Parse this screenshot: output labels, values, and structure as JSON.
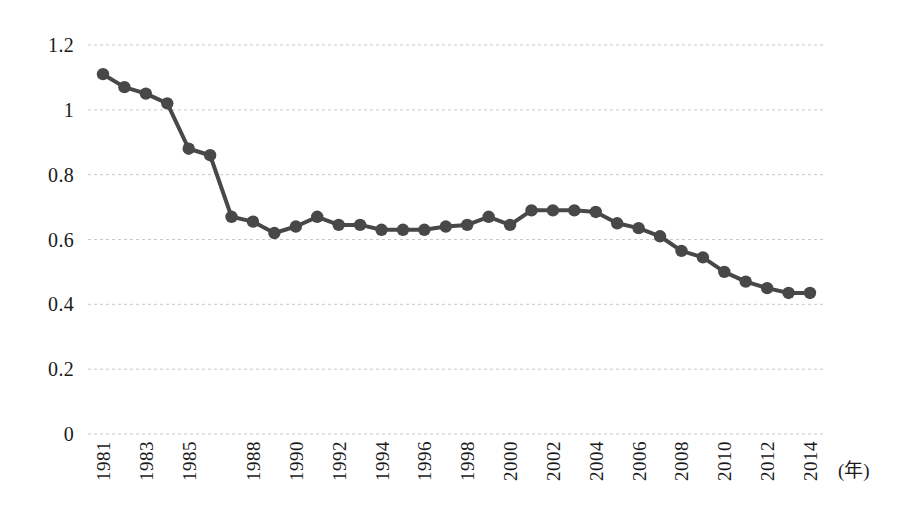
{
  "chart_data": {
    "type": "line",
    "title": "",
    "xlabel": "(年)",
    "ylabel": "",
    "xlim": [
      1981,
      2014
    ],
    "ylim": [
      0,
      1.2
    ],
    "grid": true,
    "legend": null,
    "marker": "circle",
    "series_color": "#484848",
    "y_ticks": [
      0,
      0.2,
      0.4,
      0.6,
      0.8,
      1,
      1.2
    ],
    "y_tick_labels": [
      "0",
      "0.2",
      "0.4",
      "0.6",
      "0.8",
      "1",
      "1.2"
    ],
    "x_tick_labels": [
      "1981",
      "1983",
      "1985",
      "1988",
      "1990",
      "1992",
      "1994",
      "1996",
      "1998",
      "2000",
      "2002",
      "2004",
      "2006",
      "2008",
      "2010",
      "2012",
      "2014"
    ],
    "x": [
      1981,
      1982,
      1983,
      1984,
      1985,
      1986,
      1987,
      1988,
      1989,
      1990,
      1991,
      1992,
      1993,
      1994,
      1995,
      1996,
      1997,
      1998,
      1999,
      2000,
      2001,
      2002,
      2003,
      2004,
      2005,
      2006,
      2007,
      2008,
      2009,
      2010,
      2011,
      2012,
      2013,
      2014
    ],
    "values": [
      1.11,
      1.07,
      1.05,
      1.02,
      0.88,
      0.86,
      0.67,
      0.655,
      0.62,
      0.64,
      0.67,
      0.645,
      0.645,
      0.63,
      0.63,
      0.63,
      0.64,
      0.645,
      0.67,
      0.645,
      0.69,
      0.69,
      0.69,
      0.685,
      0.65,
      0.635,
      0.61,
      0.565,
      0.545,
      0.5,
      0.47,
      0.45,
      0.435,
      0.435
    ],
    "series": [
      {
        "name": "値",
        "values": [
          1.11,
          1.07,
          1.05,
          1.02,
          0.88,
          0.86,
          0.67,
          0.655,
          0.62,
          0.64,
          0.67,
          0.645,
          0.645,
          0.63,
          0.63,
          0.63,
          0.64,
          0.645,
          0.67,
          0.645,
          0.69,
          0.69,
          0.69,
          0.685,
          0.65,
          0.635,
          0.61,
          0.565,
          0.545,
          0.5,
          0.47,
          0.45,
          0.435,
          0.435
        ]
      }
    ]
  },
  "axis": {
    "y_labels": [
      "1.2",
      "1",
      "0.8",
      "0.6",
      "0.4",
      "0.2",
      "0"
    ],
    "x_unit": "(年)"
  }
}
